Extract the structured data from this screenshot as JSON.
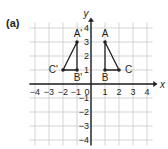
{
  "figure": {
    "part_label": "(a)",
    "axes": {
      "x_label": "x",
      "y_label": "y",
      "x_range": [
        -4,
        4
      ],
      "y_range": [
        -4,
        4
      ],
      "x_ticks": [
        "−4",
        "−3",
        "−2",
        "−1",
        "0",
        "1",
        "2",
        "3",
        "4"
      ],
      "y_ticks": [
        "4",
        "3",
        "2",
        "1",
        "−1",
        "−2",
        "−3",
        "−4"
      ],
      "grid": true
    },
    "triangles": [
      {
        "name": "ABC",
        "points": [
          {
            "label": "A",
            "x": 1,
            "y": 3
          },
          {
            "label": "B",
            "x": 1,
            "y": 1
          },
          {
            "label": "C",
            "x": 2,
            "y": 1
          }
        ]
      },
      {
        "name": "A'B'C'",
        "points": [
          {
            "label": "A'",
            "x": -1,
            "y": 3
          },
          {
            "label": "B'",
            "x": -1,
            "y": 1
          },
          {
            "label": "C'",
            "x": -2,
            "y": 1
          }
        ]
      }
    ],
    "colors": {
      "grid": "#c8c8c8",
      "axis": "#231f20",
      "shape": "#231f20",
      "text": "#231f20"
    }
  }
}
